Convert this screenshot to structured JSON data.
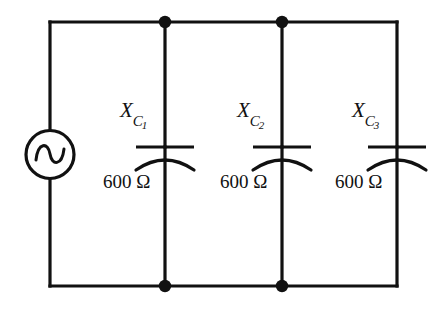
{
  "diagram": {
    "background_color": "#ffffff",
    "line_color": "#111111",
    "source": {
      "type": "ac-voltage-source",
      "symbol": "sine-wave-in-circle",
      "label": ""
    },
    "branches": [
      {
        "id": "branch-1",
        "component": "capacitor",
        "symbol_name": "capacitor-icon",
        "reactance_symbol": "X",
        "reactance_subscript": "C",
        "reactance_index": "1",
        "reactance_label": "XC1",
        "value": "600",
        "unit": "Ω",
        "value_label": "600 Ω",
        "has_node_dots": true
      },
      {
        "id": "branch-2",
        "component": "capacitor",
        "symbol_name": "capacitor-icon",
        "reactance_symbol": "X",
        "reactance_subscript": "C",
        "reactance_index": "2",
        "reactance_label": "XC2",
        "value": "600",
        "unit": "Ω",
        "value_label": "600 Ω",
        "has_node_dots": true
      },
      {
        "id": "branch-3",
        "component": "capacitor",
        "symbol_name": "capacitor-icon",
        "reactance_symbol": "X",
        "reactance_subscript": "C",
        "reactance_index": "3",
        "reactance_label": "XC3",
        "value": "600",
        "unit": "Ω",
        "value_label": "600 Ω",
        "has_node_dots": false
      }
    ]
  }
}
